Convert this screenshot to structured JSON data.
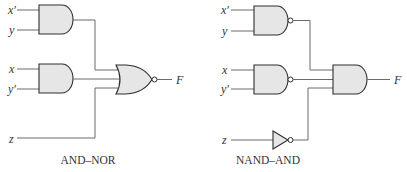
{
  "diagrams": [
    {
      "caption": "AND–NOR",
      "inputs": [
        "x′",
        "y",
        "x",
        "y′",
        "z"
      ],
      "gates": [
        "AND",
        "AND",
        "NOR"
      ],
      "output": "F"
    },
    {
      "caption": "NAND–AND",
      "inputs": [
        "x′",
        "y",
        "x",
        "y′",
        "z"
      ],
      "gates": [
        "NAND",
        "NAND",
        "NOT",
        "AND"
      ],
      "output": "F"
    }
  ],
  "colors": {
    "gate_fill": "#e6e6e6",
    "gate_stroke": "#2e2e2e",
    "wire": "#6b6b6b"
  }
}
